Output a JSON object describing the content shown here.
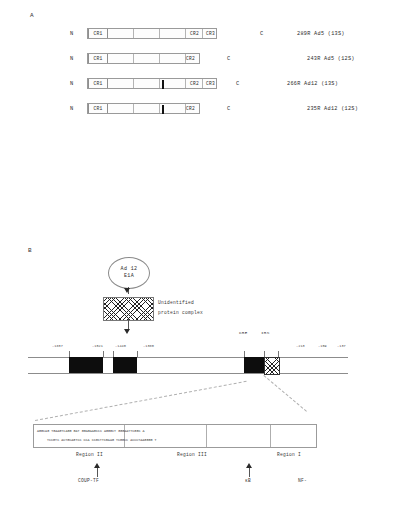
{
  "figure": {
    "panel_a": {
      "letter": "A",
      "n_terminus": "N",
      "c_terminus": "C",
      "rows": [
        {
          "id": "ad5-13s",
          "n_label": "N",
          "c_label": "C",
          "cr1": "CR1",
          "cr2": "CR2",
          "cr3": "CR3",
          "has_cr3": true,
          "has_black_bar": false,
          "size_label": "289R",
          "serotype": "Ad5",
          "mrna": "(13S)",
          "right_text": "289R  Ad5  (13S)"
        },
        {
          "id": "ad5-12s",
          "n_label": "N",
          "c_label": "C",
          "cr1": "CR1",
          "cr2": "CR2",
          "cr3": "",
          "has_cr3": false,
          "has_black_bar": false,
          "size_label": "243R",
          "serotype": "Ad5",
          "mrna": "(12S)",
          "right_text": "243R  Ad5  (12S)"
        },
        {
          "id": "ad12-13s",
          "n_label": "N",
          "c_label": "C",
          "cr1": "CR1",
          "cr2": "CR2",
          "cr3": "CR3",
          "has_cr3": true,
          "has_black_bar": true,
          "size_label": "266R",
          "serotype": "Ad12",
          "mrna": "(13S)",
          "right_text": "266R  Ad12  (13S)"
        },
        {
          "id": "ad12-12s",
          "n_label": "N",
          "c_label": "C",
          "cr1": "CR1",
          "cr2": "CR2",
          "cr3": "",
          "has_cr3": false,
          "has_black_bar": true,
          "size_label": "235R",
          "serotype": "Ad12",
          "mrna": "(12S)",
          "right_text": "235R  Ad12  (12S)"
        }
      ]
    },
    "panel_b": {
      "letter": "B",
      "source_node": {
        "line1": "Ad 12",
        "line2": "E1A"
      },
      "complex_node": {
        "label_line1": "Unidentified",
        "label_line2": "protein complex"
      },
      "promoter": {
        "left_coordinates": [
          "-1837",
          "-1521",
          "-1440",
          "-1380"
        ],
        "right_coordinates": [
          "-213",
          "-159",
          "-137"
        ],
        "element_labels": [
          "CRE",
          "IRS"
        ]
      },
      "sequence_panel": {
        "row_top": "AGGCAG TGAAGTCAGG  GAT GGAGAAGCCC    AGGGCT    GGGAATTCGGC  A",
        "row_bottom": "TCCGTC  ACTGCAGTCC   CCA  CCGCTTCGAAG    TCGGCC    ACCCTAAGGGG  T",
        "regions": [
          "Region II",
          "Region III",
          "Region I"
        ],
        "factors": [
          "COUP-TF",
          "κB",
          "NF-"
        ]
      }
    }
  }
}
